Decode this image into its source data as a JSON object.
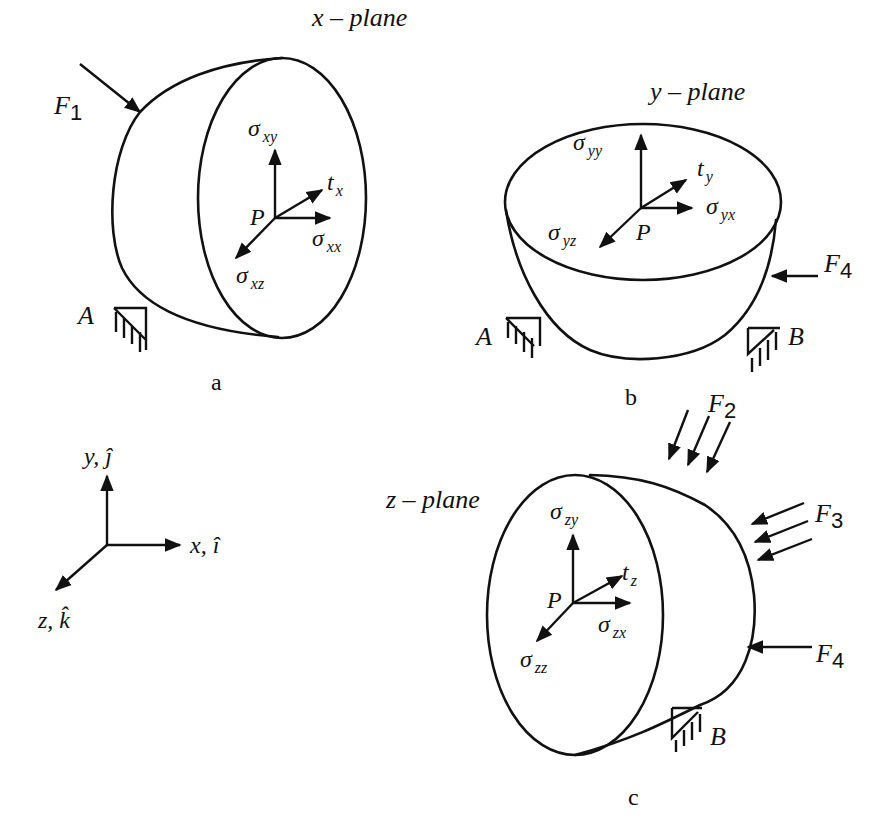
{
  "figure": {
    "panels": [
      {
        "id": "a",
        "caption": "a",
        "plane_label": "x – plane",
        "point": "P",
        "traction": {
          "sym": "t",
          "sub": "x"
        },
        "stresses": [
          {
            "sym": "σ",
            "sub": "xy",
            "direction": "up"
          },
          {
            "sym": "σ",
            "sub": "xx",
            "direction": "right"
          },
          {
            "sym": "σ",
            "sub": "xz",
            "direction": "down-left"
          }
        ],
        "forces": [
          {
            "sym": "F",
            "sub": "1"
          }
        ],
        "supports": [
          "A"
        ]
      },
      {
        "id": "b",
        "caption": "b",
        "plane_label": "y – plane",
        "point": "P",
        "traction": {
          "sym": "t",
          "sub": "y"
        },
        "stresses": [
          {
            "sym": "σ",
            "sub": "yy",
            "direction": "up"
          },
          {
            "sym": "σ",
            "sub": "yx",
            "direction": "right"
          },
          {
            "sym": "σ",
            "sub": "yz",
            "direction": "down-left"
          }
        ],
        "forces": [
          {
            "sym": "F",
            "sub": "4"
          }
        ],
        "supports": [
          "A",
          "B"
        ]
      },
      {
        "id": "c",
        "caption": "c",
        "plane_label": "z – plane",
        "point": "P",
        "traction": {
          "sym": "t",
          "sub": "z"
        },
        "stresses": [
          {
            "sym": "σ",
            "sub": "zy",
            "direction": "up"
          },
          {
            "sym": "σ",
            "sub": "zx",
            "direction": "right"
          },
          {
            "sym": "σ",
            "sub": "zz",
            "direction": "down-left"
          }
        ],
        "forces": [
          {
            "sym": "F",
            "sub": "2"
          },
          {
            "sym": "F",
            "sub": "3"
          },
          {
            "sym": "F",
            "sub": "4"
          }
        ],
        "supports": [
          "B"
        ]
      }
    ],
    "axes": {
      "y": "y, ĵ",
      "x": "x, î",
      "z": "z, k̂"
    }
  }
}
